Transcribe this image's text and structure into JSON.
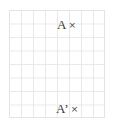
{
  "figure": {
    "background_color": "#ffffff",
    "grid": {
      "line_color": "#e9e9ec",
      "columns": 8,
      "rows": 8,
      "cell_width": 12,
      "cell_height": 13.5
    },
    "points": [
      {
        "id": "point-a",
        "label": "A",
        "marker": "×",
        "marker_name": "cross-point-marker",
        "text_color": "#3a3a3a"
      },
      {
        "id": "point-a-prime",
        "label": "A’",
        "marker": "×",
        "marker_name": "cross-point-marker",
        "text_color": "#3a3a3a"
      }
    ]
  }
}
